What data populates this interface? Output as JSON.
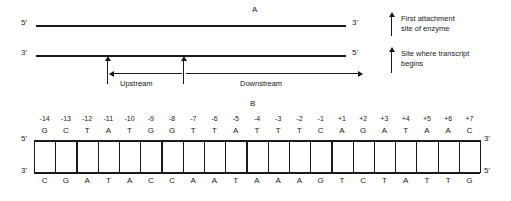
{
  "panel_a": {
    "letter": "A",
    "top_strand": {
      "left_end": "5'",
      "right_end": "3'"
    },
    "bottom_strand": {
      "left_end": "3'",
      "right_end": "5'"
    },
    "upstream_label": "Upstream",
    "downstream_label": "Downstream"
  },
  "legend": {
    "items": [
      {
        "icon": "arrow-up-icon",
        "line1": "First attachment",
        "line2": "site of enzyme"
      },
      {
        "icon": "arrow-up-icon",
        "line1": "Site where transcript",
        "line2": "begins"
      }
    ]
  },
  "panel_b": {
    "letter": "B",
    "top_strand": {
      "left_end": "5'",
      "right_end": "3'"
    },
    "bottom_strand": {
      "left_end": "3'",
      "right_end": "5'"
    },
    "positions": [
      "-14",
      "-13",
      "-12",
      "-11",
      "-10",
      "-9",
      "-8",
      "-7",
      "-6",
      "-5",
      "-4",
      "-3",
      "-2",
      "-1",
      "+1",
      "+2",
      "+3",
      "+4",
      "+5",
      "+6",
      "+7"
    ],
    "top_bases": [
      "G",
      "C",
      "T",
      "A",
      "T",
      "G",
      "G",
      "T",
      "T",
      "A",
      "T",
      "T",
      "T",
      "C",
      "A",
      "G",
      "A",
      "T",
      "A",
      "A",
      "C"
    ],
    "bottom_bases": [
      "C",
      "G",
      "A",
      "T",
      "A",
      "C",
      "C",
      "A",
      "A",
      "T",
      "A",
      "A",
      "A",
      "G",
      "T",
      "C",
      "T",
      "A",
      "T",
      "T",
      "G"
    ]
  },
  "colors": {
    "ink": "#1a1a1a",
    "background": "#ffffff"
  }
}
